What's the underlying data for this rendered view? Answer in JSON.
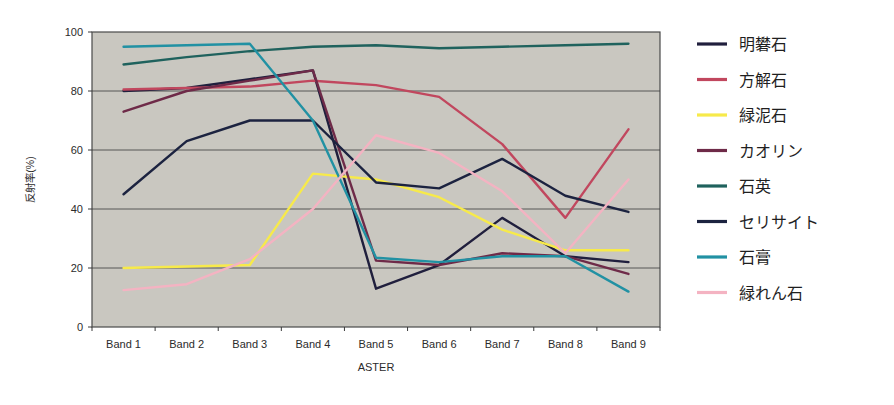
{
  "chart_data": {
    "type": "line",
    "title": "",
    "xlabel": "ASTER",
    "ylabel": "反射率(%)",
    "categories": [
      "Band 1",
      "Band 2",
      "Band 3",
      "Band 4",
      "Band 5",
      "Band 6",
      "Band 7",
      "Band 8",
      "Band 9"
    ],
    "ylim": [
      0,
      100
    ],
    "yticks": [
      0,
      20,
      40,
      60,
      80,
      100
    ],
    "grid": true,
    "legend_position": "right",
    "plot_background": "#c9c7c0",
    "series": [
      {
        "name": "明礬石",
        "color": "#201f3d",
        "values": [
          80,
          81,
          84,
          87,
          13,
          21,
          37,
          24,
          22
        ]
      },
      {
        "name": "方解石",
        "color": "#c1475e",
        "values": [
          80.5,
          81,
          81.5,
          83.5,
          82,
          78,
          62,
          37,
          67
        ]
      },
      {
        "name": "緑泥石",
        "color": "#f7ea4a",
        "values": [
          20,
          20.5,
          21,
          52,
          50,
          44,
          33,
          26,
          26
        ]
      },
      {
        "name": "カオリン",
        "color": "#6e2a48",
        "values": [
          73,
          80,
          83.5,
          87,
          22.5,
          21,
          25,
          24,
          18
        ]
      },
      {
        "name": "石英",
        "color": "#1f625d",
        "values": [
          89,
          91.5,
          93.5,
          95,
          95.5,
          94.5,
          95,
          95.5,
          96
        ]
      },
      {
        "name": "セリサイト",
        "color": "#1c2340",
        "values": [
          45,
          63,
          70,
          70,
          49,
          47,
          57,
          44.5,
          39
        ]
      },
      {
        "name": "石膏",
        "color": "#2191a3",
        "values": [
          95,
          95.5,
          96,
          70,
          23.5,
          22,
          24,
          24,
          12
        ]
      },
      {
        "name": "緑れん石",
        "color": "#f4b3c2",
        "values": [
          12.5,
          14.5,
          23,
          40,
          65,
          59,
          46,
          25,
          50
        ]
      }
    ]
  },
  "legend": {
    "items": [
      {
        "label": "明礬石",
        "color": "#201f3d"
      },
      {
        "label": "方解石",
        "color": "#c1475e"
      },
      {
        "label": "緑泥石",
        "color": "#f7ea4a"
      },
      {
        "label": "カオリン",
        "color": "#6e2a48"
      },
      {
        "label": "石英",
        "color": "#1f625d"
      },
      {
        "label": "セリサイト",
        "color": "#1c2340"
      },
      {
        "label": "石膏",
        "color": "#2191a3"
      },
      {
        "label": "緑れん石",
        "color": "#f4b3c2"
      }
    ]
  }
}
